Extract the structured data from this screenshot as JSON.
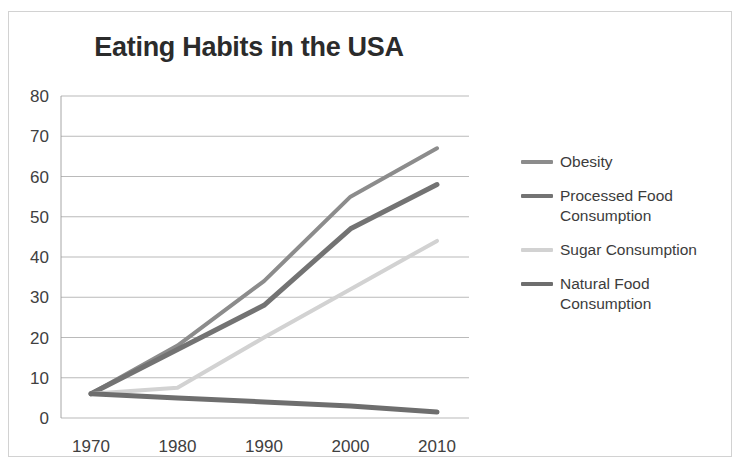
{
  "chart_data": {
    "type": "line",
    "title": "Eating Habits in the USA",
    "xlabel": "",
    "ylabel": "",
    "x": [
      1970,
      1980,
      1990,
      2000,
      2010
    ],
    "xtick_labels": [
      "1970",
      "1980",
      "1990",
      "2000",
      "2010"
    ],
    "ytick_labels": [
      "0",
      "10",
      "20",
      "30",
      "40",
      "50",
      "60",
      "70",
      "80"
    ],
    "yticks": [
      0,
      10,
      20,
      30,
      40,
      50,
      60,
      70,
      80
    ],
    "ylim": [
      0,
      80
    ],
    "xlim": [
      1965,
      2015
    ],
    "grid": "horizontal",
    "legend_position": "right",
    "series": [
      {
        "name": "Obesity",
        "values": [
          6,
          18,
          34,
          55,
          67
        ],
        "color": "#8c8c8c",
        "width": 4
      },
      {
        "name": "Processed Food\nConsumption",
        "legend_text": "Processed Food Consumption",
        "values": [
          6,
          17,
          28,
          47,
          58
        ],
        "color": "#737373",
        "width": 5
      },
      {
        "name": "Sugar Consumption",
        "legend_text": "Sugar Consumption",
        "values": [
          6,
          7.5,
          20,
          32,
          44
        ],
        "color": "#d2d2d2",
        "width": 4
      },
      {
        "name": "Natural Food\nConsumption",
        "legend_text": "Natural Food Consumption",
        "values": [
          6,
          5,
          4,
          3,
          1.5
        ],
        "color": "#6e6e6e",
        "width": 5
      }
    ]
  },
  "legend": {
    "items": [
      {
        "label": "Obesity",
        "color": "#8c8c8c"
      },
      {
        "label": "Processed Food\nConsumption",
        "color": "#737373"
      },
      {
        "label": "Sugar Consumption",
        "color": "#d2d2d2"
      },
      {
        "label": "Natural Food\nConsumption",
        "color": "#6e6e6e"
      }
    ]
  },
  "colors": {
    "frame_border": "#d2d2d2",
    "gridline": "#9c9c9c",
    "title_text": "#2b2b2b",
    "tick_text": "#404040",
    "background": "#ffffff"
  }
}
